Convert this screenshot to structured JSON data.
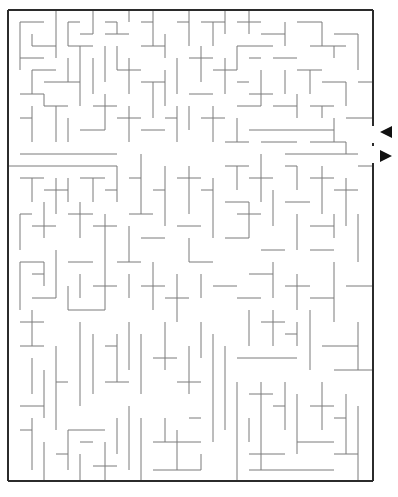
{
  "puzzle": {
    "type": "maze",
    "colors": {
      "wall": "#7a7a7a",
      "border": "#2b2b2b",
      "arrow": "#111111",
      "background": "#ffffff"
    },
    "border": {
      "left": 8,
      "top": 10,
      "right": 373,
      "bottom": 481
    },
    "openings": [
      {
        "side": "right",
        "y1": 126,
        "y2": 143,
        "label": "entrance"
      },
      {
        "side": "right",
        "y1": 146,
        "y2": 163,
        "label": "exit"
      }
    ],
    "arrows": [
      {
        "name": "entrance-arrow",
        "direction": "left",
        "x": 386,
        "y": 132
      },
      {
        "name": "exit-arrow",
        "direction": "right",
        "x": 386,
        "y": 156
      }
    ],
    "cell_size": 12.1,
    "walls": [
      [
        20,
        22,
        44,
        22
      ],
      [
        20,
        22,
        20,
        70
      ],
      [
        32,
        34,
        32,
        46
      ],
      [
        32,
        46,
        56,
        46
      ],
      [
        56,
        10,
        56,
        58
      ],
      [
        20,
        58,
        44,
        58
      ],
      [
        32,
        70,
        56,
        70
      ],
      [
        32,
        70,
        32,
        94
      ],
      [
        44,
        82,
        80,
        82
      ],
      [
        68,
        58,
        68,
        82
      ],
      [
        80,
        70,
        80,
        106
      ],
      [
        20,
        94,
        44,
        94
      ],
      [
        44,
        94,
        44,
        106
      ],
      [
        32,
        106,
        32,
        142
      ],
      [
        20,
        118,
        32,
        118
      ],
      [
        44,
        106,
        68,
        106
      ],
      [
        56,
        106,
        56,
        142
      ],
      [
        20,
        154,
        117,
        154
      ],
      [
        8,
        166,
        117,
        166
      ],
      [
        68,
        22,
        80,
        22
      ],
      [
        68,
        22,
        68,
        46
      ],
      [
        68,
        46,
        93,
        46
      ],
      [
        80,
        34,
        93,
        34
      ],
      [
        93,
        10,
        93,
        34
      ],
      [
        105,
        22,
        117,
        22
      ],
      [
        117,
        22,
        117,
        34
      ],
      [
        105,
        34,
        129,
        34
      ],
      [
        129,
        10,
        129,
        22
      ],
      [
        141,
        22,
        153,
        22
      ],
      [
        153,
        10,
        153,
        46
      ],
      [
        80,
        46,
        80,
        70
      ],
      [
        105,
        46,
        105,
        82
      ],
      [
        93,
        58,
        93,
        94
      ],
      [
        117,
        46,
        117,
        70
      ],
      [
        117,
        70,
        141,
        70
      ],
      [
        129,
        58,
        129,
        94
      ],
      [
        141,
        46,
        165,
        46
      ],
      [
        165,
        34,
        165,
        58
      ],
      [
        177,
        22,
        189,
        22
      ],
      [
        189,
        10,
        189,
        46
      ],
      [
        201,
        22,
        225,
        22
      ],
      [
        213,
        22,
        213,
        46
      ],
      [
        225,
        10,
        225,
        34
      ],
      [
        93,
        106,
        117,
        106
      ],
      [
        105,
        94,
        105,
        130
      ],
      [
        117,
        118,
        141,
        118
      ],
      [
        129,
        106,
        129,
        142
      ],
      [
        68,
        118,
        68,
        142
      ],
      [
        80,
        130,
        105,
        130
      ],
      [
        141,
        82,
        165,
        82
      ],
      [
        153,
        82,
        153,
        118
      ],
      [
        165,
        70,
        165,
        106
      ],
      [
        177,
        58,
        177,
        94
      ],
      [
        189,
        58,
        213,
        58
      ],
      [
        201,
        46,
        201,
        82
      ],
      [
        213,
        70,
        237,
        70
      ],
      [
        225,
        58,
        225,
        94
      ],
      [
        189,
        94,
        213,
        94
      ],
      [
        141,
        130,
        165,
        130
      ],
      [
        165,
        118,
        177,
        118
      ],
      [
        177,
        106,
        177,
        142
      ],
      [
        189,
        106,
        189,
        130
      ],
      [
        201,
        118,
        225,
        118
      ],
      [
        213,
        106,
        213,
        142
      ],
      [
        237,
        22,
        261,
        22
      ],
      [
        249,
        10,
        249,
        34
      ],
      [
        261,
        34,
        285,
        34
      ],
      [
        285,
        22,
        285,
        46
      ],
      [
        297,
        22,
        322,
        22
      ],
      [
        322,
        22,
        322,
        46
      ],
      [
        334,
        34,
        358,
        34
      ],
      [
        358,
        34,
        358,
        70
      ],
      [
        310,
        46,
        346,
        46
      ],
      [
        334,
        46,
        334,
        58
      ],
      [
        237,
        46,
        273,
        46
      ],
      [
        237,
        46,
        237,
        70
      ],
      [
        249,
        58,
        261,
        58
      ],
      [
        273,
        58,
        297,
        58
      ],
      [
        261,
        70,
        261,
        106
      ],
      [
        285,
        70,
        285,
        94
      ],
      [
        297,
        70,
        322,
        70
      ],
      [
        310,
        70,
        310,
        94
      ],
      [
        322,
        82,
        346,
        82
      ],
      [
        346,
        82,
        346,
        106
      ],
      [
        358,
        82,
        373,
        82
      ],
      [
        237,
        82,
        249,
        82
      ],
      [
        249,
        94,
        273,
        94
      ],
      [
        237,
        106,
        261,
        106
      ],
      [
        273,
        106,
        297,
        106
      ],
      [
        297,
        94,
        297,
        118
      ],
      [
        310,
        106,
        334,
        106
      ],
      [
        322,
        106,
        322,
        118
      ],
      [
        346,
        118,
        373,
        118
      ],
      [
        237,
        118,
        237,
        142
      ],
      [
        249,
        130,
        334,
        130
      ],
      [
        334,
        118,
        334,
        142
      ],
      [
        261,
        142,
        297,
        142
      ],
      [
        310,
        142,
        346,
        142
      ],
      [
        346,
        142,
        346,
        154
      ],
      [
        285,
        154,
        358,
        154
      ],
      [
        225,
        142,
        249,
        142
      ],
      [
        20,
        178,
        44,
        178
      ],
      [
        32,
        178,
        32,
        202
      ],
      [
        44,
        190,
        68,
        190
      ],
      [
        56,
        178,
        56,
        214
      ],
      [
        68,
        178,
        68,
        202
      ],
      [
        80,
        178,
        105,
        178
      ],
      [
        93,
        178,
        93,
        202
      ],
      [
        105,
        190,
        117,
        190
      ],
      [
        117,
        166,
        117,
        202
      ],
      [
        20,
        214,
        32,
        214
      ],
      [
        20,
        214,
        20,
        250
      ],
      [
        32,
        226,
        56,
        226
      ],
      [
        44,
        202,
        44,
        238
      ],
      [
        68,
        214,
        93,
        214
      ],
      [
        80,
        202,
        80,
        238
      ],
      [
        93,
        226,
        117,
        226
      ],
      [
        105,
        214,
        105,
        250
      ],
      [
        129,
        178,
        141,
        178
      ],
      [
        141,
        154,
        141,
        214
      ],
      [
        153,
        190,
        165,
        190
      ],
      [
        165,
        166,
        165,
        226
      ],
      [
        129,
        214,
        153,
        214
      ],
      [
        129,
        226,
        129,
        262
      ],
      [
        141,
        238,
        165,
        238
      ],
      [
        177,
        178,
        201,
        178
      ],
      [
        189,
        166,
        189,
        214
      ],
      [
        201,
        190,
        213,
        190
      ],
      [
        213,
        178,
        213,
        238
      ],
      [
        177,
        226,
        201,
        226
      ],
      [
        189,
        238,
        189,
        262
      ],
      [
        225,
        166,
        249,
        166
      ],
      [
        237,
        166,
        237,
        190
      ],
      [
        249,
        178,
        273,
        178
      ],
      [
        261,
        154,
        261,
        202
      ],
      [
        285,
        166,
        297,
        166
      ],
      [
        297,
        166,
        297,
        190
      ],
      [
        310,
        178,
        334,
        178
      ],
      [
        322,
        166,
        322,
        214
      ],
      [
        334,
        190,
        358,
        190
      ],
      [
        346,
        178,
        346,
        226
      ],
      [
        358,
        166,
        373,
        166
      ],
      [
        225,
        202,
        249,
        202
      ],
      [
        237,
        214,
        261,
        214
      ],
      [
        249,
        202,
        249,
        238
      ],
      [
        273,
        190,
        273,
        226
      ],
      [
        285,
        202,
        310,
        202
      ],
      [
        297,
        214,
        297,
        250
      ],
      [
        310,
        226,
        334,
        226
      ],
      [
        334,
        214,
        334,
        238
      ],
      [
        358,
        214,
        358,
        262
      ],
      [
        225,
        238,
        249,
        238
      ],
      [
        261,
        250,
        285,
        250
      ],
      [
        310,
        250,
        334,
        250
      ],
      [
        20,
        262,
        44,
        262
      ],
      [
        20,
        262,
        20,
        310
      ],
      [
        32,
        274,
        44,
        274
      ],
      [
        44,
        262,
        44,
        286
      ],
      [
        32,
        298,
        56,
        298
      ],
      [
        56,
        250,
        56,
        298
      ],
      [
        20,
        322,
        44,
        322
      ],
      [
        32,
        310,
        32,
        346
      ],
      [
        68,
        262,
        93,
        262
      ],
      [
        80,
        274,
        80,
        298
      ],
      [
        68,
        286,
        68,
        310
      ],
      [
        68,
        310,
        105,
        310
      ],
      [
        93,
        286,
        117,
        286
      ],
      [
        105,
        250,
        105,
        310
      ],
      [
        117,
        262,
        141,
        262
      ],
      [
        129,
        274,
        129,
        298
      ],
      [
        141,
        286,
        165,
        286
      ],
      [
        153,
        262,
        153,
        310
      ],
      [
        165,
        298,
        189,
        298
      ],
      [
        177,
        274,
        177,
        322
      ],
      [
        189,
        262,
        213,
        262
      ],
      [
        201,
        274,
        201,
        298
      ],
      [
        213,
        286,
        237,
        286
      ],
      [
        249,
        274,
        273,
        274
      ],
      [
        273,
        262,
        273,
        298
      ],
      [
        285,
        286,
        310,
        286
      ],
      [
        297,
        274,
        297,
        310
      ],
      [
        310,
        298,
        334,
        298
      ],
      [
        334,
        262,
        334,
        322
      ],
      [
        346,
        286,
        373,
        286
      ],
      [
        237,
        298,
        261,
        298
      ],
      [
        249,
        310,
        249,
        346
      ],
      [
        261,
        322,
        285,
        322
      ],
      [
        273,
        310,
        273,
        346
      ],
      [
        285,
        334,
        297,
        334
      ],
      [
        297,
        322,
        297,
        346
      ],
      [
        310,
        310,
        310,
        370
      ],
      [
        322,
        346,
        358,
        346
      ],
      [
        358,
        322,
        358,
        370
      ],
      [
        237,
        358,
        297,
        358
      ],
      [
        334,
        370,
        373,
        370
      ],
      [
        80,
        322,
        80,
        406
      ],
      [
        93,
        334,
        93,
        394
      ],
      [
        105,
        346,
        117,
        346
      ],
      [
        117,
        334,
        117,
        382
      ],
      [
        105,
        382,
        129,
        382
      ],
      [
        129,
        322,
        129,
        370
      ],
      [
        141,
        334,
        141,
        394
      ],
      [
        153,
        358,
        177,
        358
      ],
      [
        165,
        322,
        165,
        370
      ],
      [
        177,
        382,
        201,
        382
      ],
      [
        189,
        346,
        189,
        394
      ],
      [
        201,
        322,
        201,
        358
      ],
      [
        213,
        334,
        213,
        442
      ],
      [
        225,
        346,
        225,
        430
      ],
      [
        20,
        346,
        44,
        346
      ],
      [
        32,
        358,
        32,
        394
      ],
      [
        20,
        406,
        44,
        406
      ],
      [
        44,
        370,
        44,
        418
      ],
      [
        56,
        382,
        68,
        382
      ],
      [
        56,
        346,
        56,
        430
      ],
      [
        20,
        430,
        32,
        430
      ],
      [
        32,
        418,
        32,
        470
      ],
      [
        44,
        442,
        44,
        481
      ],
      [
        56,
        454,
        68,
        454
      ],
      [
        68,
        430,
        68,
        470
      ],
      [
        68,
        430,
        105,
        430
      ],
      [
        80,
        442,
        93,
        442
      ],
      [
        80,
        454,
        80,
        481
      ],
      [
        93,
        466,
        117,
        466
      ],
      [
        105,
        442,
        105,
        481
      ],
      [
        117,
        418,
        117,
        454
      ],
      [
        129,
        406,
        129,
        470
      ],
      [
        141,
        418,
        141,
        481
      ],
      [
        153,
        442,
        201,
        442
      ],
      [
        165,
        418,
        165,
        442
      ],
      [
        177,
        430,
        177,
        470
      ],
      [
        189,
        418,
        201,
        418
      ],
      [
        201,
        454,
        201,
        470
      ],
      [
        153,
        470,
        201,
        470
      ],
      [
        237,
        382,
        237,
        481
      ],
      [
        249,
        394,
        273,
        394
      ],
      [
        261,
        382,
        261,
        470
      ],
      [
        249,
        418,
        249,
        442
      ],
      [
        273,
        406,
        285,
        406
      ],
      [
        285,
        382,
        285,
        430
      ],
      [
        297,
        394,
        297,
        454
      ],
      [
        310,
        406,
        334,
        406
      ],
      [
        322,
        382,
        322,
        430
      ],
      [
        334,
        418,
        346,
        418
      ],
      [
        346,
        394,
        346,
        454
      ],
      [
        358,
        406,
        358,
        481
      ],
      [
        249,
        454,
        285,
        454
      ],
      [
        249,
        470,
        334,
        470
      ],
      [
        297,
        442,
        334,
        442
      ],
      [
        334,
        454,
        358,
        454
      ]
    ]
  }
}
